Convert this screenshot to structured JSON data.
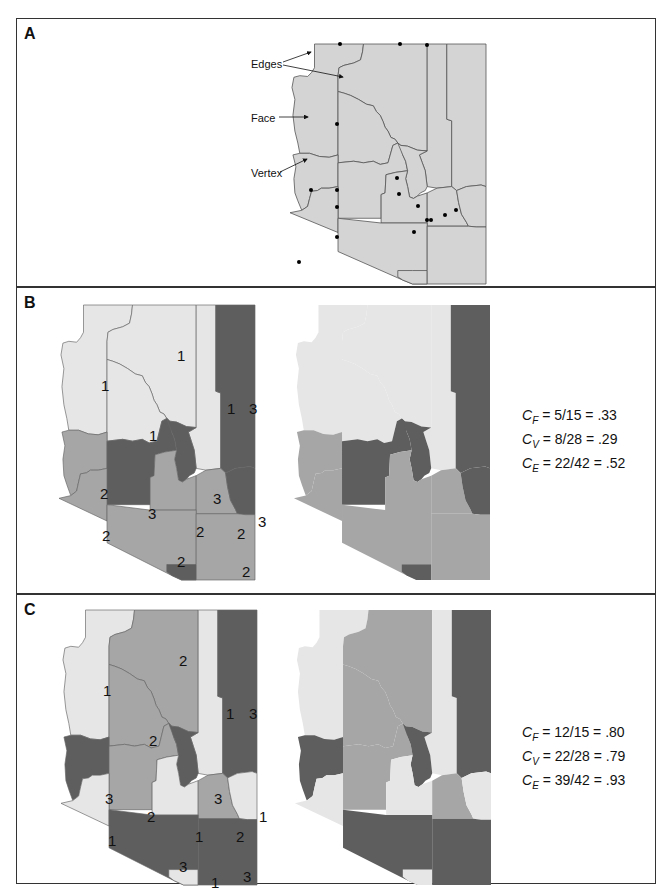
{
  "panels": {
    "a": {
      "label": "A",
      "annotations": {
        "edges": "Edges",
        "face": "Face",
        "vertex": "Vertex"
      }
    },
    "b": {
      "label": "B",
      "stats": [
        {
          "symbol": "C",
          "sub": "F",
          "value": "= 5/15 = .33"
        },
        {
          "symbol": "C",
          "sub": "V",
          "value": "= 8/28 = .29"
        },
        {
          "symbol": "C",
          "sub": "E",
          "value": "= 22/42 = .52"
        }
      ],
      "region_labels": [
        "1",
        "1",
        "1",
        "1",
        "2",
        "3",
        "3",
        "3",
        "3",
        "2",
        "2",
        "2",
        "2",
        "2",
        "2"
      ]
    },
    "c": {
      "label": "C",
      "stats": [
        {
          "symbol": "C",
          "sub": "F",
          "value": "= 12/15 = .80"
        },
        {
          "symbol": "C",
          "sub": "V",
          "value": "= 22/28 = .79"
        },
        {
          "symbol": "C",
          "sub": "E",
          "value": "= 39/42 = .93"
        }
      ],
      "region_labels": [
        "1",
        "2",
        "2",
        "1",
        "3",
        "3",
        "2",
        "3",
        "1",
        "1",
        "2",
        "1",
        "3",
        "3",
        "1"
      ]
    }
  },
  "colors": {
    "class1": "#e6e6e6",
    "class2": "#a6a6a6",
    "class3": "#5e5e5e",
    "base": "#d6d6d6",
    "line": "#555555",
    "vertex": "#000000"
  }
}
